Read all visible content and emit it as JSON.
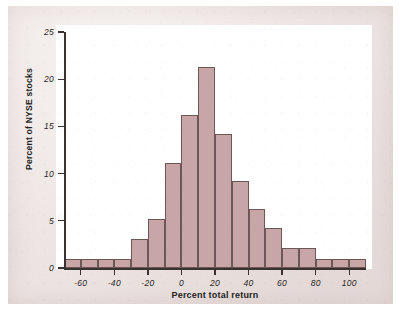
{
  "figure": {
    "background_color": "#ece4e2",
    "plot_background_color": "#ffffff",
    "bar_fill_color": "#c8a5a6",
    "bar_edge_color": "#6b5755",
    "axis_color": "#3a3230"
  },
  "chart_data": {
    "type": "bar",
    "title": "",
    "subtitle": "",
    "xlabel": "Percent total return",
    "ylabel": "Percent of NYSE stocks",
    "xlim": [
      -70,
      110
    ],
    "ylim": [
      0,
      25
    ],
    "bin_width": 10,
    "grid": false,
    "legend": null,
    "xticks": [
      -60,
      -40,
      -20,
      0,
      20,
      40,
      60,
      80,
      100
    ],
    "xtick_labels": [
      "-60",
      "-40",
      "-20",
      "0",
      "20",
      "40",
      "60",
      "80",
      "100"
    ],
    "yticks": [
      0,
      5,
      10,
      15,
      20,
      25
    ],
    "ytick_labels": [
      "0",
      "5",
      "10",
      "15",
      "20",
      "25"
    ],
    "bins": [
      {
        "left": -70,
        "right": -60,
        "center": -65,
        "value": 1.0
      },
      {
        "left": -60,
        "right": -50,
        "center": -55,
        "value": 1.0
      },
      {
        "left": -50,
        "right": -40,
        "center": -45,
        "value": 1.0
      },
      {
        "left": -40,
        "right": -30,
        "center": -35,
        "value": 1.0
      },
      {
        "left": -30,
        "right": -20,
        "center": -25,
        "value": 3.1
      },
      {
        "left": -20,
        "right": -10,
        "center": -15,
        "value": 5.2
      },
      {
        "left": -10,
        "right": 0,
        "center": -5,
        "value": 11.1
      },
      {
        "left": 0,
        "right": 10,
        "center": 5,
        "value": 16.2
      },
      {
        "left": 10,
        "right": 20,
        "center": 15,
        "value": 21.3
      },
      {
        "left": 20,
        "right": 30,
        "center": 25,
        "value": 14.2
      },
      {
        "left": 30,
        "right": 40,
        "center": 35,
        "value": 9.2
      },
      {
        "left": 40,
        "right": 50,
        "center": 45,
        "value": 6.2
      },
      {
        "left": 50,
        "right": 60,
        "center": 55,
        "value": 4.2
      },
      {
        "left": 60,
        "right": 70,
        "center": 65,
        "value": 2.1
      },
      {
        "left": 70,
        "right": 80,
        "center": 75,
        "value": 2.1
      },
      {
        "left": 80,
        "right": 90,
        "center": 85,
        "value": 1.0
      },
      {
        "left": 90,
        "right": 100,
        "center": 95,
        "value": 1.0
      },
      {
        "left": 100,
        "right": 110,
        "center": 105,
        "value": 1.0
      }
    ],
    "categories": [
      "-70 to -60",
      "-60 to -50",
      "-50 to -40",
      "-40 to -30",
      "-30 to -20",
      "-20 to -10",
      "-10 to 0",
      "0 to 10",
      "10 to 20",
      "20 to 30",
      "30 to 40",
      "40 to 50",
      "50 to 60",
      "60 to 70",
      "70 to 80",
      "80 to 90",
      "90 to 100",
      "100 to 110"
    ],
    "values": [
      1.0,
      1.0,
      1.0,
      1.0,
      3.1,
      5.2,
      11.1,
      16.2,
      21.3,
      14.2,
      9.2,
      6.2,
      4.2,
      2.1,
      2.1,
      1.0,
      1.0,
      1.0
    ]
  }
}
